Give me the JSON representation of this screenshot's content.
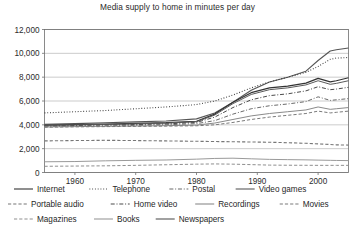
{
  "chart_data": {
    "type": "line",
    "title": "Media supply to home in minutes per day",
    "xlabel": "",
    "ylabel": "",
    "xlim": [
      1955,
      2005
    ],
    "ylim": [
      0,
      12000
    ],
    "grid": true,
    "legend_position": "bottom",
    "x_ticks": [
      "1960",
      "1970",
      "1980",
      "1990",
      "2000"
    ],
    "x_tick_values": [
      1960,
      1970,
      1980,
      1990,
      2000
    ],
    "y_ticks": [
      "0",
      "2,000",
      "4,000",
      "6,000",
      "8,000",
      "10,000",
      "12,000"
    ],
    "y_tick_values": [
      0,
      2000,
      4000,
      6000,
      8000,
      10000,
      12000
    ],
    "x": [
      1955,
      1960,
      1965,
      1970,
      1975,
      1980,
      1983,
      1986,
      1989,
      1992,
      1995,
      1998,
      2000,
      2002,
      2003,
      2005
    ],
    "series": [
      {
        "name": "Newspapers",
        "style": "solid",
        "color": "#555555",
        "width": 1.1,
        "values": [
          4050,
          4100,
          4180,
          4250,
          4320,
          4500,
          5000,
          5900,
          6900,
          7600,
          8000,
          8500,
          9400,
          10200,
          10300,
          10450
        ]
      },
      {
        "name": "Telephone",
        "style": "dotted",
        "color": "#3a3a3a",
        "width": 1.1,
        "values": [
          5000,
          5100,
          5200,
          5350,
          5500,
          5700,
          6000,
          6500,
          7100,
          7600,
          8000,
          8400,
          8900,
          9500,
          9600,
          9650
        ]
      },
      {
        "name": "Internet",
        "style": "solid",
        "color": "#333333",
        "width": 1.2,
        "values": [
          3980,
          4020,
          4060,
          4120,
          4180,
          4300,
          4900,
          5900,
          6700,
          7100,
          7250,
          7500,
          7900,
          7600,
          7700,
          7950
        ]
      },
      {
        "name": "Video games",
        "style": "solid",
        "color": "#5a5a5a",
        "width": 1.0,
        "values": [
          3950,
          3990,
          4030,
          4080,
          4140,
          4260,
          4820,
          5780,
          6550,
          6950,
          7100,
          7350,
          7700,
          7400,
          7480,
          7700
        ]
      },
      {
        "name": "Home video",
        "style": "dashdot",
        "color": "#4a4a4a",
        "width": 1.0,
        "values": [
          3900,
          3940,
          3980,
          4020,
          4080,
          4200,
          4650,
          5450,
          6100,
          6450,
          6600,
          6850,
          7200,
          6950,
          7000,
          7150
        ]
      },
      {
        "name": "Postal",
        "style": "dashdot",
        "color": "#6a6a6a",
        "width": 1.0,
        "values": [
          3850,
          3880,
          3910,
          3950,
          4000,
          4100,
          4350,
          4900,
          5350,
          5600,
          5750,
          5950,
          6350,
          6050,
          6100,
          6200
        ]
      },
      {
        "name": "Recordings",
        "style": "solid",
        "color": "#8a8a8a",
        "width": 1.0,
        "values": [
          3820,
          3850,
          3880,
          3900,
          3930,
          3980,
          4150,
          4450,
          4750,
          4950,
          5100,
          5250,
          5500,
          5300,
          5350,
          5450
        ]
      },
      {
        "name": "Movies",
        "style": "dashed",
        "color": "#7a7a7a",
        "width": 1.0,
        "values": [
          3800,
          3830,
          3850,
          3870,
          3890,
          3920,
          4000,
          4200,
          4450,
          4650,
          4800,
          4950,
          5150,
          5000,
          5050,
          5150
        ]
      },
      {
        "name": "Portable audio",
        "style": "dashed",
        "color": "#777777",
        "width": 1.1,
        "values": [
          2650,
          2680,
          2700,
          2680,
          2650,
          2620,
          2600,
          2580,
          2560,
          2540,
          2500,
          2450,
          2400,
          2350,
          2320,
          2300
        ]
      },
      {
        "name": "Books",
        "style": "solid",
        "color": "#9a9a9a",
        "width": 1.0,
        "values": [
          900,
          920,
          980,
          1020,
          1050,
          1120,
          1180,
          1200,
          1150,
          1100,
          1080,
          1060,
          1040,
          1020,
          1010,
          1000
        ]
      },
      {
        "name": "Magazines",
        "style": "dashed",
        "color": "#8f8f8f",
        "width": 1.0,
        "values": [
          520,
          540,
          560,
          600,
          650,
          700,
          720,
          700,
          660,
          620,
          610,
          605,
          600,
          600,
          600,
          600
        ]
      }
    ],
    "legend_rows": [
      [
        {
          "label": "Internet",
          "style": "solid",
          "color": "#333333"
        },
        {
          "label": "Telephone",
          "style": "dotted",
          "color": "#3a3a3a"
        },
        {
          "label": "Postal",
          "style": "dashdot",
          "color": "#6a6a6a"
        },
        {
          "label": "Video games",
          "style": "solid",
          "color": "#5a5a5a"
        }
      ],
      [
        {
          "label": "Portable audio",
          "style": "dashed",
          "color": "#777777"
        },
        {
          "label": "Home video",
          "style": "dashdot",
          "color": "#4a4a4a"
        },
        {
          "label": "Recordings",
          "style": "solid",
          "color": "#8a8a8a"
        },
        {
          "label": "Movies",
          "style": "dashed",
          "color": "#7a7a7a"
        }
      ],
      [
        {
          "label": "Magazines",
          "style": "dashed",
          "color": "#8f8f8f"
        },
        {
          "label": "Books",
          "style": "solid",
          "color": "#9a9a9a"
        },
        {
          "label": "Newspapers",
          "style": "solid",
          "color": "#555555"
        }
      ]
    ]
  }
}
